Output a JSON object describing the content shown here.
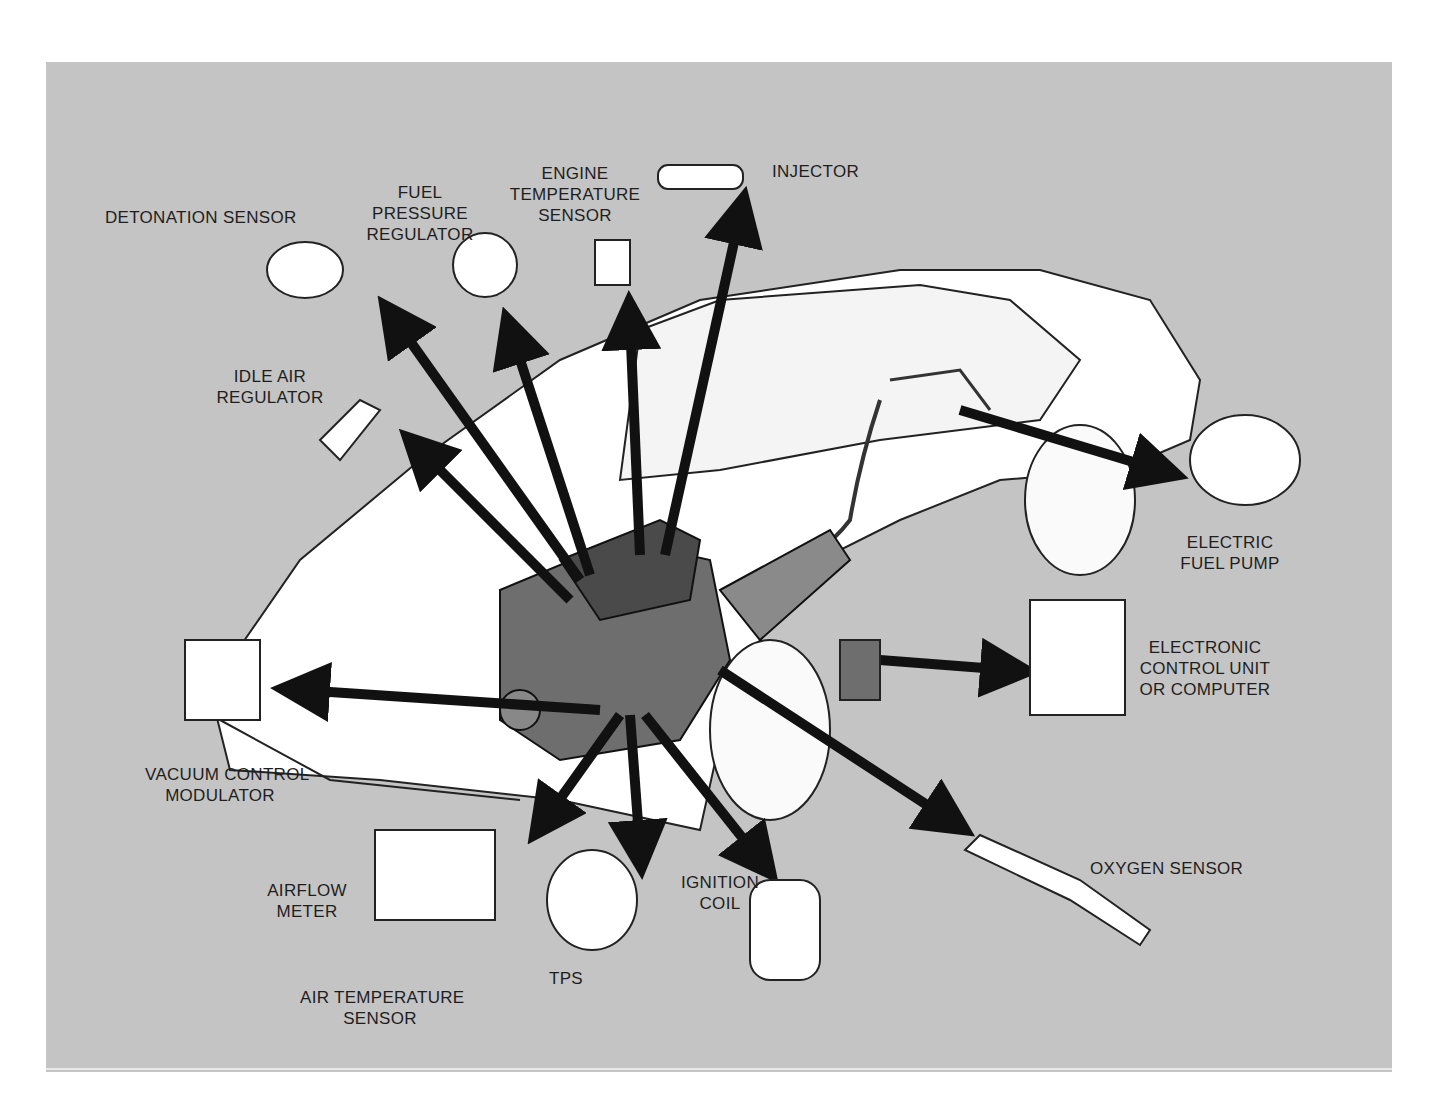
{
  "diagram": {
    "background_color": "#c4c4c4",
    "arrow_color": "#111111",
    "center": "engine",
    "labels": {
      "detonation_sensor": [
        "DETONATION SENSOR"
      ],
      "fuel_pressure_regulator": [
        "FUEL",
        "PRESSURE",
        "REGULATOR"
      ],
      "engine_temperature_sensor": [
        "ENGINE",
        "TEMPERATURE",
        "SENSOR"
      ],
      "injector": [
        "INJECTOR"
      ],
      "idle_air_regulator": [
        "IDLE AIR",
        "REGULATOR"
      ],
      "electric_fuel_pump": [
        "ELECTRIC",
        "FUEL PUMP"
      ],
      "electronic_control_unit": [
        "ELECTRONIC",
        "CONTROL UNIT",
        "OR COMPUTER"
      ],
      "vacuum_control_modulator": [
        "VACUUM CONTROL",
        "MODULATOR"
      ],
      "airflow_meter": [
        "AIRFLOW",
        "METER"
      ],
      "air_temperature_sensor": [
        "AIR TEMPERATURE",
        "SENSOR"
      ],
      "tps": [
        "TPS"
      ],
      "ignition_coil": [
        "IGNITION",
        "COIL"
      ],
      "oxygen_sensor": [
        "OXYGEN SENSOR"
      ]
    }
  }
}
